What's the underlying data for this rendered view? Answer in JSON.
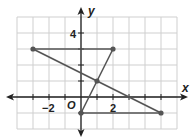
{
  "chart_data": {
    "type": "line",
    "title": "",
    "xlabel": "x",
    "ylabel": "y",
    "origin_label": "O",
    "xlim": [
      -4,
      6
    ],
    "ylim": [
      -2,
      5
    ],
    "grid": true,
    "x_tick_labels": [
      {
        "value": -2,
        "label": "−2"
      },
      {
        "value": 2,
        "label": "2"
      }
    ],
    "y_tick_labels": [
      {
        "value": 4,
        "label": "4"
      }
    ],
    "points": [
      {
        "x": -3,
        "y": 3
      },
      {
        "x": 2,
        "y": 3
      },
      {
        "x": 0,
        "y": -1
      },
      {
        "x": 5,
        "y": -1
      },
      {
        "x": 1,
        "y": 1
      }
    ],
    "segments": [
      {
        "from": [
          -3,
          3
        ],
        "to": [
          2,
          3
        ]
      },
      {
        "from": [
          2,
          3
        ],
        "to": [
          0,
          -1
        ]
      },
      {
        "from": [
          -3,
          3
        ],
        "to": [
          5,
          -1
        ]
      },
      {
        "from": [
          0,
          -1
        ],
        "to": [
          5,
          -1
        ]
      }
    ],
    "colors": {
      "grid": "#cfcfcf",
      "axis": "#222222",
      "segment": "#555555",
      "point": "#555555"
    }
  },
  "labels": {
    "x_axis": "x",
    "y_axis": "y",
    "origin": "O",
    "tick_x_neg2": "−2",
    "tick_x_2": "2",
    "tick_y_4": "4"
  }
}
